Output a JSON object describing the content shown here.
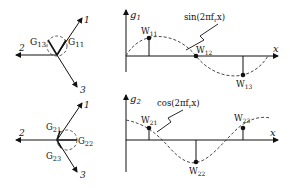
{
  "top": {
    "vector_labels": {
      "v1": "1",
      "v2": "2",
      "v3": "3"
    },
    "G_labels": {
      "a": "G",
      "a_sub": "13",
      "b": "G",
      "b_sub": "11"
    },
    "axis_y": "g",
    "axis_y_sub": "1",
    "axis_x": "x",
    "curve_label": "sin(2πf",
    "curve_label_sub": "r",
    "curve_label_end": "x)",
    "weights": [
      {
        "w": "W",
        "sub": "11"
      },
      {
        "w": "W",
        "sub": "12"
      },
      {
        "w": "W",
        "sub": "13"
      }
    ]
  },
  "bottom": {
    "vector_labels": {
      "v1": "1",
      "v2": "2",
      "v3": "3"
    },
    "G_labels": {
      "a": "G",
      "a_sub": "21",
      "b": "G",
      "b_sub": "22",
      "c": "G",
      "c_sub": "23"
    },
    "axis_y": "g",
    "axis_y_sub": "2",
    "axis_x": "x",
    "curve_label": "cos(2πf",
    "curve_label_sub": "r",
    "curve_label_end": "x)",
    "weights": [
      {
        "w": "W",
        "sub": "21"
      },
      {
        "w": "W",
        "sub": "22"
      },
      {
        "w": "W",
        "sub": "23"
      }
    ]
  }
}
